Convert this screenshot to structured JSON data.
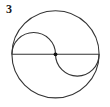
{
  "figure": {
    "label": "3",
    "stroke_color": "#333333",
    "dot_color": "#111111",
    "background": "#ffffff"
  },
  "geometry": {
    "outer_circle": {
      "cx": 55.5,
      "cy": 54.3,
      "r": 43.6
    },
    "diameter": {
      "x1": 11.9,
      "y1": 54.3,
      "x2": 99.1,
      "y2": 54.3
    },
    "center_dot": {
      "cx": 55.5,
      "cy": 54.3,
      "r": 1.9
    },
    "upper_left_semicircle": {
      "cx": 33.7,
      "cy": 54.3,
      "r": 21.8,
      "side": "above"
    },
    "lower_right_semicircle": {
      "cx": 77.3,
      "cy": 54.3,
      "r": 21.8,
      "side": "below"
    }
  }
}
